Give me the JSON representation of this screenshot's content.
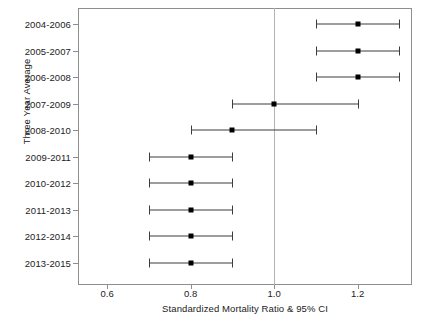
{
  "chart_data": {
    "type": "scatter",
    "subtype": "forest-plot",
    "title": "",
    "xlabel": "Standardized Mortality Ratio & 95% CI",
    "ylabel": "Three Year Average",
    "xlim": [
      0.53,
      1.33
    ],
    "xticks": [
      0.6,
      0.8,
      1.0,
      1.2
    ],
    "xtick_labels": [
      "0.6",
      "0.8",
      "1.0",
      "1.2"
    ],
    "grid": false,
    "legend": "none",
    "reference_line": 1.0,
    "categories": [
      "2004-2006",
      "2005-2007",
      "2006-2008",
      "2007-2009",
      "2008-2010",
      "2009-2011",
      "2010-2012",
      "2011-2013",
      "2012-2014",
      "2013-2015"
    ],
    "values": [
      1.2,
      1.2,
      1.2,
      1.0,
      0.9,
      0.8,
      0.8,
      0.8,
      0.8,
      0.8
    ],
    "ci_lower": [
      1.1,
      1.1,
      1.1,
      0.9,
      0.8,
      0.7,
      0.7,
      0.7,
      0.7,
      0.7
    ],
    "ci_upper": [
      1.3,
      1.3,
      1.3,
      1.2,
      1.1,
      0.9,
      0.9,
      0.9,
      0.9,
      0.9
    ],
    "points": [
      {
        "category": "2004-2006",
        "value": 1.2,
        "ci_lower": 1.1,
        "ci_upper": 1.3
      },
      {
        "category": "2005-2007",
        "value": 1.2,
        "ci_lower": 1.1,
        "ci_upper": 1.3
      },
      {
        "category": "2006-2008",
        "value": 1.2,
        "ci_lower": 1.1,
        "ci_upper": 1.3
      },
      {
        "category": "2007-2009",
        "value": 1.0,
        "ci_lower": 0.9,
        "ci_upper": 1.2
      },
      {
        "category": "2008-2010",
        "value": 0.9,
        "ci_lower": 0.8,
        "ci_upper": 1.1
      },
      {
        "category": "2009-2011",
        "value": 0.8,
        "ci_lower": 0.7,
        "ci_upper": 0.9
      },
      {
        "category": "2010-2012",
        "value": 0.8,
        "ci_lower": 0.7,
        "ci_upper": 0.9
      },
      {
        "category": "2011-2013",
        "value": 0.8,
        "ci_lower": 0.7,
        "ci_upper": 0.9
      },
      {
        "category": "2012-2014",
        "value": 0.8,
        "ci_lower": 0.7,
        "ci_upper": 0.9
      },
      {
        "category": "2013-2015",
        "value": 0.8,
        "ci_lower": 0.7,
        "ci_upper": 0.9
      }
    ],
    "colors": {
      "marker": "#000000",
      "ci": "#3d3d3d",
      "axis": "#8e8e8e",
      "reference_line": "#b3b3b3",
      "text": "#222222",
      "background": "#ffffff"
    }
  }
}
